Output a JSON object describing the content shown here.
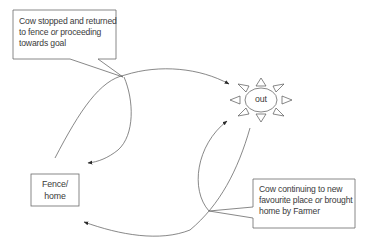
{
  "diagram": {
    "type": "flow",
    "nodes": {
      "fence": {
        "line1": "Fence/",
        "line2": "home"
      },
      "out": {
        "label": "out",
        "icon": "sun-icon"
      }
    },
    "callouts": {
      "top": {
        "line1": "Cow stopped and returned",
        "line2_a": "to fence ",
        "line2_or": "or",
        "line2_b": " proceeding",
        "line3": "towards goal"
      },
      "bottom": {
        "line1": "Cow continuing to new",
        "line2_a": "favourite place ",
        "line2_or": "or",
        "line2_b": " brought",
        "line3": "home by Farmer"
      }
    },
    "edges": [
      {
        "from": "fence",
        "to": "out",
        "desc": "upper arc from fence to out"
      },
      {
        "from": "top-crossing",
        "to": "fence",
        "desc": "curve returning to fence"
      },
      {
        "from": "bottom-crossing",
        "to": "out",
        "desc": "lower curve toward out"
      },
      {
        "from": "bottom-crossing",
        "to": "fence",
        "desc": "lower arc returning to fence"
      }
    ],
    "colors": {
      "stroke": "#555555",
      "text": "#3a3a3a",
      "background": "#ffffff"
    }
  }
}
